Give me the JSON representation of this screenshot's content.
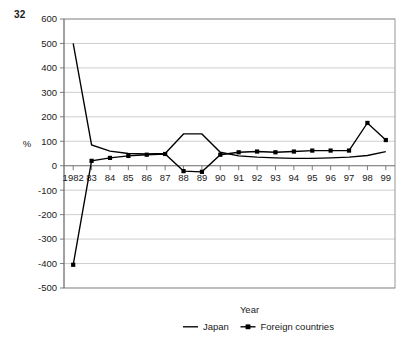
{
  "page_number": "32",
  "chart_data": {
    "type": "line",
    "title": "",
    "xlabel": "Year",
    "ylabel": "%",
    "ylim": [
      -500,
      600
    ],
    "ytick_step": 100,
    "yticks": [
      600,
      500,
      400,
      300,
      200,
      100,
      0,
      -100,
      -200,
      -300,
      -400,
      -500
    ],
    "ytick_labels": [
      "600",
      "500",
      "400",
      "300",
      "200",
      "100",
      "0",
      "-100",
      "-200",
      "-300",
      "-400",
      "-500"
    ],
    "grid": true,
    "legend_position": "bottom",
    "categories": [
      1982,
      1983,
      1984,
      1985,
      1986,
      1987,
      1988,
      1989,
      1990,
      1991,
      1992,
      1993,
      1994,
      1995,
      1996,
      1997,
      1998,
      1999
    ],
    "xtick_labels": [
      "1982",
      "83",
      "84",
      "85",
      "86",
      "87",
      "88",
      "89",
      "90",
      "91",
      "92",
      "93",
      "94",
      "95",
      "96",
      "97",
      "98",
      "99"
    ],
    "series": [
      {
        "name": "Japan",
        "marker": "none",
        "values": [
          500,
          85,
          60,
          50,
          48,
          50,
          130,
          130,
          55,
          40,
          35,
          32,
          30,
          30,
          32,
          35,
          42,
          58
        ]
      },
      {
        "name": "Foreign countries",
        "marker": "diamond",
        "values": [
          -405,
          20,
          32,
          40,
          45,
          48,
          -22,
          -25,
          45,
          55,
          58,
          55,
          58,
          62,
          62,
          62,
          175,
          105
        ]
      }
    ]
  },
  "legend": {
    "items": [
      {
        "label": "Japan",
        "marker": "none"
      },
      {
        "label": "Foreign countries",
        "marker": "diamond"
      }
    ]
  }
}
